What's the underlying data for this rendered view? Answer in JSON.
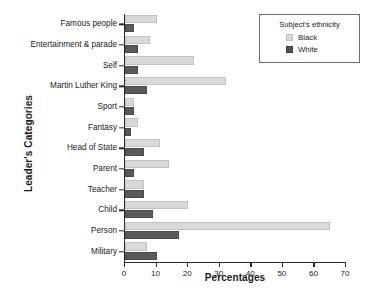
{
  "chart_data": {
    "type": "bar",
    "orientation": "horizontal",
    "title": "",
    "xlabel": "Percentages",
    "ylabel": "Leader's Categories",
    "xlim": [
      0,
      70
    ],
    "xticks": [
      0,
      10,
      20,
      30,
      40,
      50,
      60,
      70
    ],
    "grid": false,
    "legend_position": "top-right",
    "legend_title": "Subject's ethnicity",
    "categories": [
      "Famous people",
      "Entertainment & parade",
      "Self",
      "Martin Luther King",
      "Sport",
      "Fantasy",
      "Head of State",
      "Parent",
      "Teacher",
      "Child",
      "Person",
      "Military"
    ],
    "series": [
      {
        "name": "Black",
        "color": "#d9d9d9",
        "values": [
          10,
          8,
          22,
          32,
          3,
          4,
          11,
          14,
          6,
          20,
          65,
          7
        ]
      },
      {
        "name": "White",
        "color": "#5a5a5a",
        "values": [
          3,
          4,
          4,
          7,
          3,
          2,
          6,
          3,
          6,
          9,
          17,
          10
        ]
      }
    ]
  }
}
